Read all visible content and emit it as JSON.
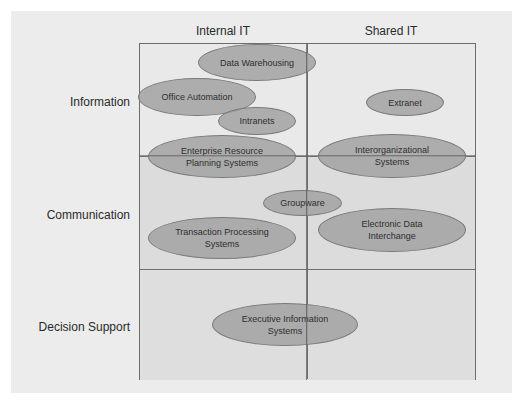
{
  "diagram": {
    "columns": [
      {
        "label": "Internal IT"
      },
      {
        "label": "Shared IT"
      }
    ],
    "rows": [
      {
        "label": "Information"
      },
      {
        "label": "Communication"
      },
      {
        "label": "Decision Support"
      }
    ],
    "systems": [
      {
        "label": "Data Warehousing"
      },
      {
        "label": "Office Automation"
      },
      {
        "label": "Intranets"
      },
      {
        "label": "Extranet"
      },
      {
        "line1": "Enterprise Resource",
        "line2": "Planning Systems"
      },
      {
        "line1": "Interorganizational",
        "line2": "Systems"
      },
      {
        "label": "Groupware"
      },
      {
        "line1": "Transaction Processing",
        "line2": "Systems"
      },
      {
        "line1": "Electronic Data",
        "line2": "Interchange"
      },
      {
        "line1": "Executive Information",
        "line2": "Systems"
      }
    ],
    "colors": {
      "panel_bg": "#ececec",
      "info_row_bg": "#e9e9e9",
      "shaded_row_bg": "#dcdcdc",
      "ellipse_fill": "#a0a0a0",
      "ellipse_border": "#7a7a7a",
      "grid_line": "#6e6e6e"
    }
  }
}
